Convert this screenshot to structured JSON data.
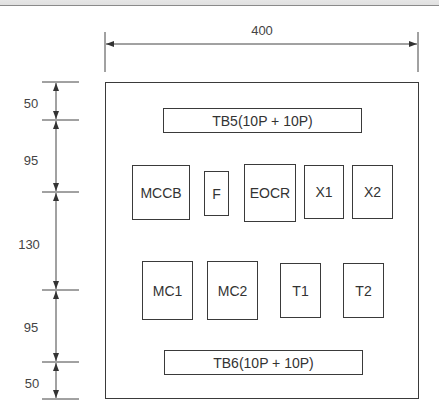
{
  "diagram": {
    "type": "panel layout drawing",
    "width_dimension": "400",
    "height_dimensions": [
      "50",
      "95",
      "130",
      "95",
      "50"
    ],
    "terminal_blocks": {
      "top": "TB5(10P + 10P)",
      "bottom": "TB6(10P + 10P)"
    },
    "row1": [
      "MCCB",
      "F",
      "EOCR",
      "X1",
      "X2"
    ],
    "row2": [
      "MC1",
      "MC2",
      "T1",
      "T2"
    ],
    "line_color": "#3a3a3a",
    "text_color": "#333333"
  }
}
